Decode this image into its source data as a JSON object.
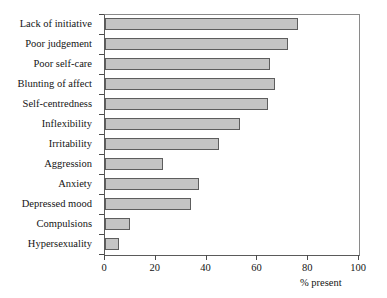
{
  "chart_data": {
    "type": "bar",
    "orientation": "horizontal",
    "title": "",
    "xlabel": "% present",
    "ylabel": "",
    "xlim": [
      0,
      100
    ],
    "xticks": [
      0,
      20,
      40,
      60,
      80,
      100
    ],
    "grid": false,
    "legend": null,
    "bar_color": "#c4c4c4",
    "bar_edge_color": "#5d5d5d",
    "categories": [
      "Lack of initiative",
      "Poor judgement",
      "Poor self-care",
      "Blunting of affect",
      "Self-centredness",
      "Inflexibility",
      "Irritability",
      "Aggression",
      "Anxiety",
      "Depressed mood",
      "Compulsions",
      "Hypersexuality"
    ],
    "values": [
      76,
      72,
      65,
      67,
      64,
      53,
      45,
      23,
      37,
      34,
      10,
      5.5
    ]
  }
}
